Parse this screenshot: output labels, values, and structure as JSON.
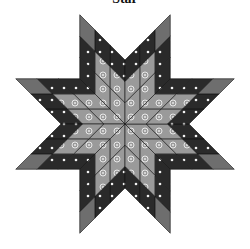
{
  "title": "Star",
  "block": {
    "name": "Lone Star quilt block",
    "points": 8,
    "cells_per_point": "3x3",
    "center": [
      125,
      124
    ],
    "point_edge_length": 64
  },
  "fabrics": {
    "light": {
      "name": "light gray with white circles",
      "color": "#9a9a9a",
      "motif": "circle"
    },
    "dark": {
      "name": "dark with white stars",
      "color": "#2a2a2a",
      "motif": "star"
    },
    "medium": {
      "name": "solid medium gray",
      "color": "#6e6e6e",
      "motif": "none"
    }
  },
  "cell_colors": [
    [
      "light",
      "light",
      "dark"
    ],
    [
      "light",
      "light",
      "dark"
    ],
    [
      "dark",
      "dark",
      "medium"
    ]
  ]
}
